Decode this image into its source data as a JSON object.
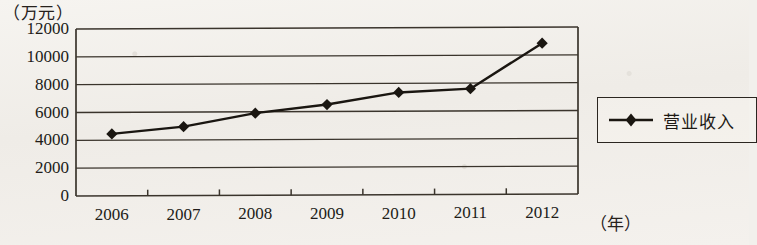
{
  "chart_data": {
    "type": "line",
    "title": "",
    "xlabel": "（年）",
    "ylabel": "（万元）",
    "categories": [
      "2006",
      "2007",
      "2008",
      "2009",
      "2010",
      "2011",
      "2012"
    ],
    "series": [
      {
        "name": "营业收入",
        "values": [
          4450,
          4950,
          5900,
          6500,
          7350,
          7600,
          10850
        ],
        "marker": "diamond",
        "color": "#1a1611"
      }
    ],
    "ylim": [
      0,
      12000
    ],
    "yticks": [
      0,
      2000,
      4000,
      6000,
      8000,
      10000,
      12000
    ],
    "ytick_labels": [
      "0",
      "2000",
      "4000",
      "6000",
      "8000",
      "10000",
      "12000"
    ],
    "grid": true,
    "grid_axis": "y",
    "legend_position": "right",
    "legend_entries": [
      "营业收入"
    ]
  },
  "axes": {
    "y_unit_label": "（万元）",
    "x_unit_label": "（年）"
  },
  "legend": {
    "items": [
      {
        "label": "营业收入",
        "marker": "diamond-line-marker",
        "color": "#1a1611"
      }
    ]
  },
  "colors": {
    "ink": "#1d1914",
    "grid": "#3a342c",
    "paper": "#f2f0ec",
    "series": "#1a1611"
  }
}
